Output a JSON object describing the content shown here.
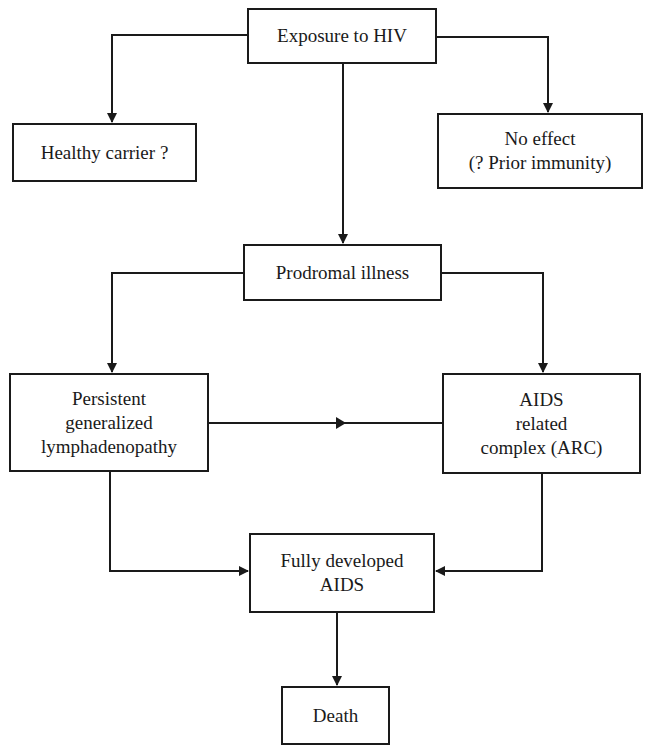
{
  "diagram": {
    "type": "flowchart",
    "nodes": {
      "exposure": {
        "lines": [
          "Exposure to HIV"
        ]
      },
      "healthy_carrier": {
        "lines": [
          "Healthy carrier ?"
        ]
      },
      "no_effect": {
        "lines": [
          "No effect",
          "(? Prior immunity)"
        ]
      },
      "prodromal": {
        "lines": [
          "Prodromal illness"
        ]
      },
      "pgl": {
        "lines": [
          "Persistent",
          "generalized",
          "lymphadenopathy"
        ]
      },
      "arc": {
        "lines": [
          "AIDS",
          "related",
          "complex (ARC)"
        ]
      },
      "full_aids": {
        "lines": [
          "Fully developed",
          "AIDS"
        ]
      },
      "death": {
        "lines": [
          "Death"
        ]
      }
    },
    "edges": [
      {
        "from": "Exposure to HIV",
        "to": "Healthy carrier ?"
      },
      {
        "from": "Exposure to HIV",
        "to": "No effect (? Prior immunity)"
      },
      {
        "from": "Exposure to HIV",
        "to": "Prodromal illness"
      },
      {
        "from": "Prodromal illness",
        "to": "Persistent generalized lymphadenopathy"
      },
      {
        "from": "Prodromal illness",
        "to": "AIDS related complex (ARC)"
      },
      {
        "from": "Persistent generalized lymphadenopathy",
        "to": "AIDS related complex (ARC)"
      },
      {
        "from": "Persistent generalized lymphadenopathy",
        "to": "Fully developed AIDS"
      },
      {
        "from": "AIDS related complex (ARC)",
        "to": "Fully developed AIDS"
      },
      {
        "from": "Fully developed AIDS",
        "to": "Death"
      }
    ],
    "line_color": "#1a1a1a"
  }
}
